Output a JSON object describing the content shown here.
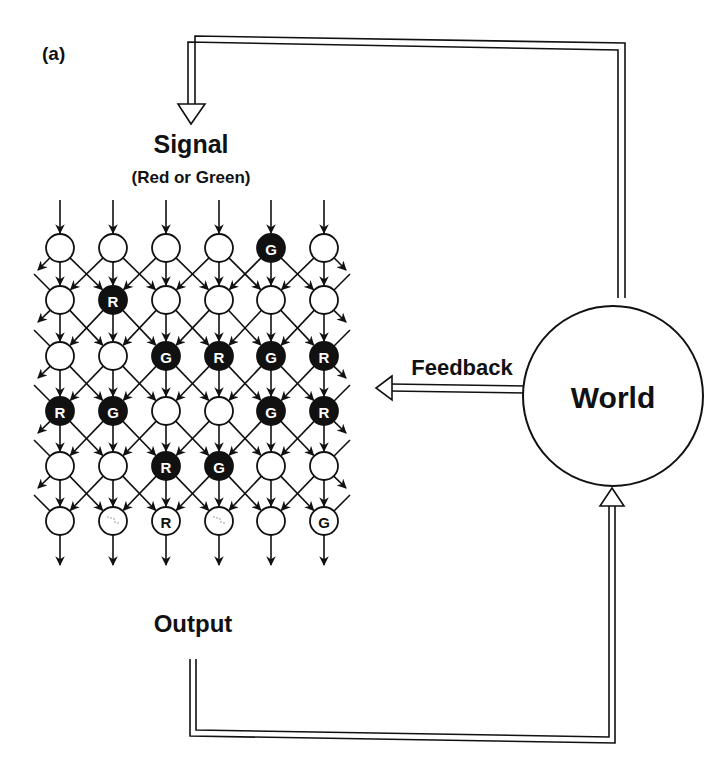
{
  "figure_label": "(a)",
  "signal": {
    "title": "Signal",
    "subtitle": "(Red or Green)"
  },
  "feedback_label": "Feedback",
  "world_label": "World",
  "output_label": "Output",
  "network": {
    "columns": 6,
    "rows": 6,
    "legend": {
      "R": "Red",
      "G": "Green"
    },
    "nodes": [
      [
        {
          "state": "empty"
        },
        {
          "state": "empty"
        },
        {
          "state": "empty"
        },
        {
          "state": "empty"
        },
        {
          "state": "filled",
          "letter": "G"
        },
        {
          "state": "empty"
        }
      ],
      [
        {
          "state": "empty"
        },
        {
          "state": "filled",
          "letter": "R"
        },
        {
          "state": "empty"
        },
        {
          "state": "empty"
        },
        {
          "state": "empty"
        },
        {
          "state": "empty"
        }
      ],
      [
        {
          "state": "empty"
        },
        {
          "state": "empty"
        },
        {
          "state": "filled",
          "letter": "G"
        },
        {
          "state": "filled",
          "letter": "R"
        },
        {
          "state": "filled",
          "letter": "G"
        },
        {
          "state": "filled",
          "letter": "R"
        }
      ],
      [
        {
          "state": "filled",
          "letter": "R"
        },
        {
          "state": "filled",
          "letter": "G"
        },
        {
          "state": "empty"
        },
        {
          "state": "empty"
        },
        {
          "state": "filled",
          "letter": "G"
        },
        {
          "state": "filled",
          "letter": "R"
        }
      ],
      [
        {
          "state": "empty"
        },
        {
          "state": "empty"
        },
        {
          "state": "filled",
          "letter": "R"
        },
        {
          "state": "filled",
          "letter": "G"
        },
        {
          "state": "empty"
        },
        {
          "state": "empty"
        }
      ],
      [
        {
          "state": "empty"
        },
        {
          "state": "speckled"
        },
        {
          "state": "outline",
          "letter": "R"
        },
        {
          "state": "speckled"
        },
        {
          "state": "empty"
        },
        {
          "state": "outline",
          "letter": "G"
        }
      ]
    ]
  }
}
